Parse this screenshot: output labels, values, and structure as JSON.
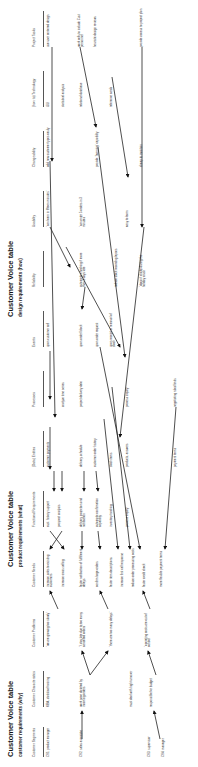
{
  "sections": [
    {
      "title": "Customer Voice table",
      "subtitle": "customer requirements (why)"
    },
    {
      "title": "Customer Voice table",
      "subtitle": "product requirements (what)"
    },
    {
      "title": "Customer Voice table",
      "subtitle": "design requirements (how)"
    }
  ],
  "columns": [
    {
      "header": "Customer Segments",
      "cells": [
        "CS1: product manager",
        "CS2: sales associate",
        "CS3: supervisor",
        "CS4: manager"
      ]
    },
    {
      "header": "Customer Characteristics",
      "cells": [
        "MBA, statistical training",
        "work pace dictated by incoming orders",
        "must deal with high turnover",
        "responsible for budget"
      ]
    },
    {
      "header": "Customer Problems",
      "cells": [
        "\"we are growing too slowly\"",
        "\"I stay late due to too many cancelled orders\"",
        "\"there are too many delays\"",
        "\"operating costs are out of control\""
      ]
    },
    {
      "header": "Customer Needs",
      "cells": [
        "increase sales to existing customers",
        "increase cross selling",
        "faster notification of fulfillment delays",
        "confirm large orders",
        "faster item descriptions",
        "increase first call response",
        "reduce order processing costs",
        "faster credit check",
        "more flexible payment terms"
      ]
    },
    {
      "header": "Functional Requirements",
      "cells": [
        "cust. history support",
        "prospect analysis",
        "delivery projection and notification",
        "automatic confirmation capability",
        "inventory tracking",
        "process inquiry",
        "payment terms"
      ]
    },
    {
      "header": "(Data) Entities",
      "cells": [
        "customer payments",
        "delivery schedule",
        "customer order history",
        "stock items",
        "products, answers",
        "payment terms"
      ]
    },
    {
      "header": "Processes",
      "cells": [
        "analyze time series",
        "project delivery date",
        "process inquiry",
        "negotiating rules/limits"
      ]
    },
    {
      "header": "Events",
      "cells": [
        "upon customer call",
        "upon order/ block",
        "upon order request",
        "upon receipt or removal of stock"
      ]
    },
    {
      "header": "Reliability",
      "cells": [
        "automatic checking if more than 3 days late",
        "reduce stock recording lapses",
        "\"doesn't choke during the holiday crush\""
      ]
    },
    {
      "header": "Usability",
      "cells": [
        "\"can learn in fifteen minutes\"",
        "\"can enter 5 orders in 3 minutes\"",
        "easy to learn"
      ]
    },
    {
      "header": "Changeability",
      "cells": [
        "add new customer types easily",
        "provide \"learning\" capability",
        "cheap to maintain"
      ]
    },
    {
      "header": "(how to) Technology",
      "cells": [
        "GUI",
        "statistical analysis",
        "relational database",
        "reference cards"
      ]
    },
    {
      "header": "Project Tasks",
      "cells": [
        "use user centered design",
        "work cells to include Cust personnel",
        "heuristic design reviews",
        "provide access to project plan"
      ]
    }
  ]
}
